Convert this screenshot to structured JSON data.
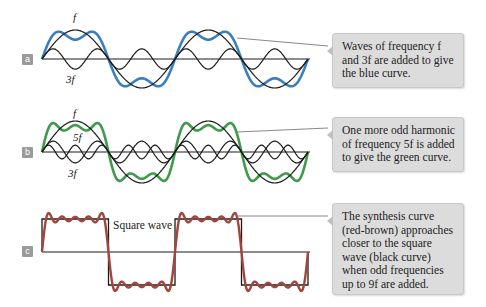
{
  "colors": {
    "blue_curve": "#3a7ec2",
    "green_curve": "#3f9a4a",
    "red_brown_curve": "#a0463c",
    "harmonic_curve": "#1a1a1a",
    "axis": "#1a1a1a",
    "connector": "#888888",
    "callout_bg": "#dcdcdc",
    "panel_label_bg": "#9a9a9a"
  },
  "panels": [
    {
      "id": "a",
      "label": "a",
      "harmonic_labels": [
        "f",
        "3f"
      ],
      "callout": "Waves of frequency f and 3f are added to give the blue curve."
    },
    {
      "id": "b",
      "label": "b",
      "harmonic_labels": [
        "f",
        "5f",
        "3f"
      ],
      "callout": "One more odd harmonic of frequency 5f is added to give the green curve."
    },
    {
      "id": "c",
      "label": "c",
      "square_wave_label": "Square wave",
      "callout": "The synthesis curve (red-brown) approaches closer to the square wave (black curve) when odd frequencies up to 9f are added."
    }
  ]
}
